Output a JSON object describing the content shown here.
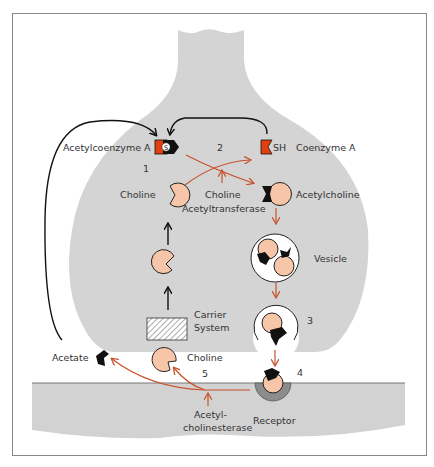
{
  "diagram": {
    "colors": {
      "terminal_fill": "#d4d4d4",
      "postsynaptic_fill": "#d2d2d2",
      "molecule_fill": "#f7c6a8",
      "acetyl_fill": "#000000",
      "coa_fill": "#e2410f",
      "enzyme_arrow": "#c8532d",
      "transport_arrow": "#000000",
      "frame": "#888888"
    },
    "labels": {
      "acetylcoenzyme_a": "Acetylcoenzyme A",
      "coenzyme_a": "Coenzyme A",
      "sh": "SH",
      "choline_top": "Choline",
      "choline_acetyltransferase_1": "Choline",
      "choline_acetyltransferase_2": "Acetyltransferase",
      "acetylcholine": "Acetylcholine",
      "vesicle": "Vesicle",
      "carrier_system_1": "Carrier",
      "carrier_system_2": "System",
      "acetate": "Acetate",
      "choline_cleft": "Choline",
      "receptor": "Receptor",
      "acetylcholinesterase_1": "Acetyl-",
      "acetylcholinesterase_2": "cholinesterase"
    },
    "steps": {
      "step1": "1",
      "step2": "2",
      "step3": "3",
      "step4": "4",
      "step5": "5"
    }
  }
}
